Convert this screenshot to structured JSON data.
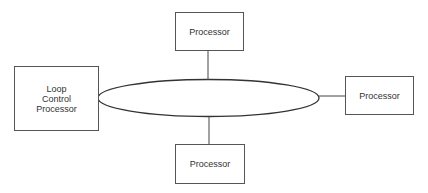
{
  "diagram": {
    "nodes": [
      {
        "id": "top",
        "label": "Processor"
      },
      {
        "id": "left",
        "label": "Loop\nControl\nProcessor",
        "lines": [
          "Loop",
          "Control",
          "Processor"
        ]
      },
      {
        "id": "right",
        "label": "Processor"
      },
      {
        "id": "bottom",
        "label": "Processor"
      }
    ],
    "ring": {
      "shape": "ellipse",
      "label": ""
    },
    "edges": [
      {
        "from": "top",
        "to": "ring"
      },
      {
        "from": "left",
        "to": "ring"
      },
      {
        "from": "right",
        "to": "ring"
      },
      {
        "from": "bottom",
        "to": "ring"
      }
    ],
    "colors": {
      "stroke": "#333333",
      "background": "#ffffff"
    }
  }
}
